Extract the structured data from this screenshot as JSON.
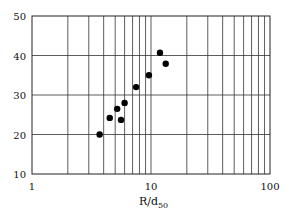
{
  "chart_data": {
    "type": "scatter",
    "title": "",
    "xlabel": "R/d",
    "xlabel_subscript": "50",
    "ylabel": "",
    "xscale": "log",
    "xlim": [
      1,
      100
    ],
    "ylim": [
      10,
      50
    ],
    "grid": true,
    "legend": null,
    "x_ticks": [
      "1",
      "10",
      "100"
    ],
    "y_ticks": [
      "10",
      "20",
      "30",
      "40",
      "50"
    ],
    "series": [
      {
        "name": "data",
        "marker": "filled-circle",
        "color": "#000000",
        "points": [
          {
            "x": 3.7,
            "y": 20.0
          },
          {
            "x": 4.5,
            "y": 24.2
          },
          {
            "x": 5.2,
            "y": 26.5
          },
          {
            "x": 5.6,
            "y": 23.7
          },
          {
            "x": 6.0,
            "y": 28.0
          },
          {
            "x": 7.5,
            "y": 32.0
          },
          {
            "x": 9.6,
            "y": 35.0
          },
          {
            "x": 11.9,
            "y": 40.7
          },
          {
            "x": 13.3,
            "y": 37.9
          }
        ]
      }
    ]
  }
}
